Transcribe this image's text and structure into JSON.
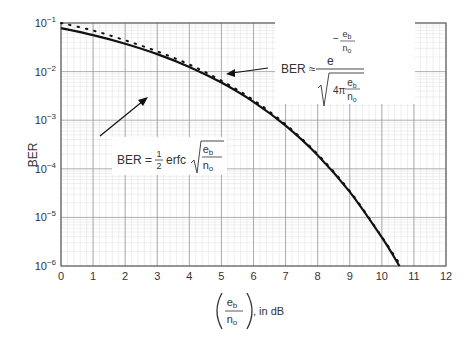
{
  "chart_data": {
    "type": "line",
    "title": "",
    "xlabel": "(e_b / n_o), in dB",
    "ylabel": "BER",
    "xlim": [
      0,
      12
    ],
    "ylim": [
      1e-06,
      0.1
    ],
    "yscale": "log",
    "grid": true,
    "x_ticks": [
      "0",
      "1",
      "2",
      "3",
      "4",
      "5",
      "6",
      "7",
      "8",
      "9",
      "10",
      "11",
      "12"
    ],
    "y_ticks": [
      "10^-1",
      "10^-2",
      "10^-3",
      "10^-4",
      "10^-5",
      "10^-6"
    ],
    "series": [
      {
        "name": "BER = 1/2 erfc sqrt(e_b/n_o)",
        "style": "solid",
        "x": [
          0,
          1,
          2,
          3,
          4,
          5,
          6,
          7,
          8,
          9,
          10,
          10.55
        ],
        "values": [
          0.0786,
          0.0563,
          0.0375,
          0.0229,
          0.0125,
          0.00595,
          0.00239,
          0.000773,
          0.000191,
          3.36e-05,
          3.87e-06,
          1e-06
        ]
      },
      {
        "name": "BER ≈ e^(-e_b/n_o) / sqrt(4π e_b/n_o)",
        "style": "dotted",
        "x": [
          0,
          1,
          2,
          3,
          4,
          5,
          6,
          7,
          8,
          9,
          10,
          10.6
        ],
        "values": [
          0.104,
          0.07,
          0.044,
          0.026,
          0.014,
          0.0065,
          0.0026,
          0.00082,
          0.0002,
          3.5e-05,
          4e-06,
          1e-06
        ]
      }
    ],
    "annotations": [
      {
        "text": "BER = 1/2 erfc sqrt(e_b/n_o)",
        "points_to": "solid curve"
      },
      {
        "text": "BER ≈ e^(-e_b/n_o) / sqrt(4π e_b/n_o)",
        "points_to": "dotted curve"
      }
    ]
  },
  "labels": {
    "ylabel": "BER",
    "x_unit": ", in dB",
    "frac_num": "e",
    "frac_num_sub": "b",
    "frac_den": "n",
    "frac_den_sub": "o",
    "ann1_prefix": "BER =",
    "ann1_half_num": "1",
    "ann1_half_den": "2",
    "ann1_func": "erfc",
    "ann2_prefix": "BER ≈",
    "ann2_base": "e",
    "ann2_minus": "−",
    "ann2_four_pi": "4π"
  }
}
